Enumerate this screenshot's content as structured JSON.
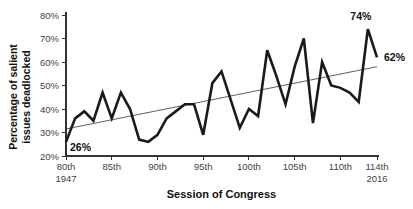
{
  "chart_data": {
    "type": "line",
    "title": "",
    "xlabel": "Session of Congress",
    "ylabel": "Percentage of salient issues deadlocked",
    "ylabel_lines": [
      "Percentage of salient",
      "issues deadlocked"
    ],
    "grid": false,
    "legend": "none",
    "ylim": [
      20,
      80
    ],
    "xlim": [
      80,
      114
    ],
    "y_ticks": [
      {
        "value": 20,
        "label": "20%"
      },
      {
        "value": 30,
        "label": "30%"
      },
      {
        "value": 40,
        "label": "40%"
      },
      {
        "value": 50,
        "label": "50%"
      },
      {
        "value": 60,
        "label": "60%"
      },
      {
        "value": 70,
        "label": "70%"
      },
      {
        "value": 80,
        "label": "80%"
      }
    ],
    "x_ticks": [
      {
        "session": 80,
        "label": "80th",
        "sublabel": "1947"
      },
      {
        "session": 85,
        "label": "85th",
        "sublabel": ""
      },
      {
        "session": 90,
        "label": "90th",
        "sublabel": ""
      },
      {
        "session": 95,
        "label": "95th",
        "sublabel": ""
      },
      {
        "session": 100,
        "label": "100th",
        "sublabel": ""
      },
      {
        "session": 105,
        "label": "105th",
        "sublabel": ""
      },
      {
        "session": 110,
        "label": "110th",
        "sublabel": ""
      },
      {
        "session": 114,
        "label": "114th",
        "sublabel": "2016"
      }
    ],
    "series": [
      {
        "name": "Percentage of salient issues deadlocked",
        "x": [
          80,
          81,
          82,
          83,
          84,
          85,
          86,
          87,
          88,
          89,
          90,
          91,
          92,
          93,
          94,
          95,
          96,
          97,
          98,
          99,
          100,
          101,
          102,
          103,
          104,
          105,
          106,
          107,
          108,
          109,
          110,
          111,
          112,
          113,
          114
        ],
        "values": [
          26,
          36,
          39,
          35,
          47,
          36,
          47,
          40,
          27,
          26,
          29,
          36,
          39,
          42,
          42,
          29,
          51,
          56,
          44,
          32,
          40,
          37,
          65,
          54,
          42,
          58,
          70,
          34,
          60,
          50,
          49,
          47,
          43,
          74,
          62
        ]
      }
    ],
    "trend_line": {
      "x1": 80,
      "y1": 31.5,
      "x2": 114,
      "y2": 58
    },
    "annotations": [
      {
        "session": 80,
        "value": 26,
        "text": "26%",
        "dx": 4,
        "dy": 9,
        "anchor": "start"
      },
      {
        "session": 113,
        "value": 74,
        "text": "74%",
        "dx": -7,
        "dy": -9,
        "anchor": "middle"
      },
      {
        "session": 114,
        "value": 62,
        "text": "62%",
        "dx": 7,
        "dy": 4,
        "anchor": "start"
      }
    ],
    "colors": {
      "line": "#1a1a1a",
      "trend": "#333333",
      "axis": "#333333",
      "tick_label": "#3f3f3f",
      "text": "#111111",
      "background": "#ffffff"
    }
  }
}
